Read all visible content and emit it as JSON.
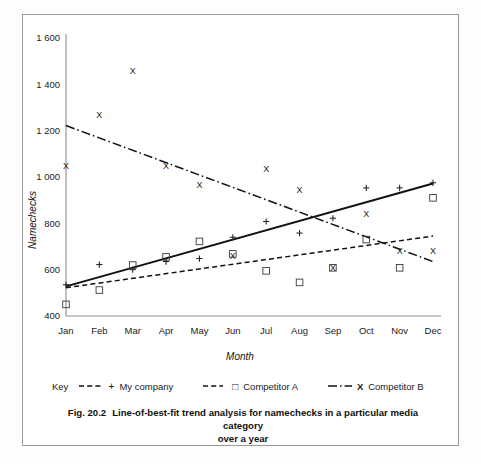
{
  "figure": {
    "number_label": "Fig. 20.2",
    "caption_line1": "Line-of-best-fit trend analysis for namechecks in a particular media category",
    "caption_line2": "over a year"
  },
  "legend": {
    "key_label": "Key",
    "items": [
      {
        "label": "My company",
        "symbol": "+",
        "line_style": "dashed-plus",
        "swatch_name": "my-company-swatch"
      },
      {
        "label": "Competitor A",
        "symbol": "□",
        "line_style": "dashed",
        "swatch_name": "competitor-a-swatch"
      },
      {
        "label": "Competitor B",
        "symbol": "X",
        "line_style": "dash-dot",
        "swatch_name": "competitor-b-swatch"
      }
    ]
  },
  "chart_data": {
    "type": "scatter",
    "title": "",
    "xlabel": "Month",
    "ylabel": "Namechecks",
    "categories": [
      "Jan",
      "Feb",
      "Mar",
      "Apr",
      "May",
      "Jun",
      "Jul",
      "Aug",
      "Sep",
      "Oct",
      "Nov",
      "Dec"
    ],
    "x_tick_labels": [
      "Jan",
      "Feb",
      "Mar",
      "Apr",
      "May",
      "Jun",
      "Jul",
      "Aug",
      "Sep",
      "Oct",
      "Nov",
      "Dec"
    ],
    "y_tick_labels": [
      "400",
      "600",
      "800",
      "1 000",
      "1 200",
      "1 400",
      "1 600"
    ],
    "y_ticks": [
      400,
      600,
      800,
      1000,
      1200,
      1400,
      1600
    ],
    "ylim": [
      400,
      1600
    ],
    "grid": false,
    "legend_position": "below-axis",
    "series": [
      {
        "name": "My company",
        "marker": "plus",
        "values": [
          535,
          622,
          600,
          635,
          648,
          740,
          808,
          758,
          822,
          953,
          953,
          975
        ],
        "trend": {
          "style": "solid",
          "start_value": 528,
          "end_value": 972
        }
      },
      {
        "name": "Competitor A",
        "marker": "square",
        "values": [
          450,
          512,
          620,
          655,
          722,
          668,
          595,
          545,
          608,
          730,
          608,
          910
        ],
        "trend": {
          "style": "dashed",
          "start_value": 522,
          "end_value": 745
        }
      },
      {
        "name": "Competitor B",
        "marker": "x",
        "values": [
          1050,
          1270,
          1460,
          1048,
          965,
          662,
          1035,
          945,
          608,
          840,
          683,
          680
        ],
        "trend": {
          "style": "dash-dot",
          "start_value": 1222,
          "end_value": 635
        }
      }
    ]
  }
}
